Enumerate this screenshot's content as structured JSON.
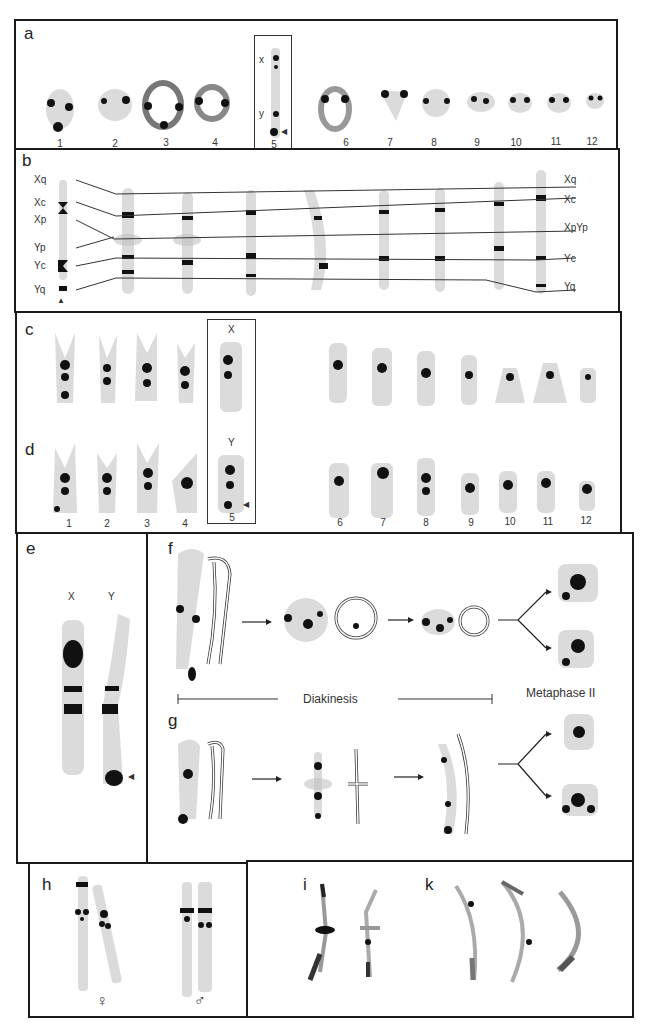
{
  "figure": {
    "panel_a": {
      "label": "a",
      "numbers": [
        "1",
        "2",
        "3",
        "4",
        "5",
        "6",
        "7",
        "8",
        "9",
        "10",
        "11",
        "12"
      ],
      "inset_labels": {
        "x": "x",
        "y": "y"
      },
      "arrowhead": "◀"
    },
    "panel_b": {
      "label": "b",
      "left_labels": [
        "Xq",
        "Xc",
        "Xp",
        "Yp",
        "Yc",
        "Yq"
      ],
      "right_labels": [
        "Xq",
        "Xc",
        "XpYp",
        "Yc",
        "Yq"
      ],
      "arrowhead": "▲"
    },
    "panel_c": {
      "label": "c",
      "inset_label": "X"
    },
    "panel_d": {
      "label": "d",
      "inset_label": "Y",
      "numbers": [
        "1",
        "2",
        "3",
        "4",
        "5",
        "6",
        "7",
        "8",
        "9",
        "10",
        "11",
        "12"
      ],
      "arrowhead": "◀"
    },
    "panel_e": {
      "label": "e",
      "x_label": "X",
      "y_label": "Y",
      "arrowhead": "◀"
    },
    "panel_f": {
      "label": "f",
      "stage_diakinesis": "Diakinesis",
      "stage_metaphase": "Metaphase II"
    },
    "panel_g": {
      "label": "g"
    },
    "panel_h": {
      "label": "h",
      "female_symbol": "♀",
      "male_symbol": "♂"
    },
    "panel_i": {
      "label": "i"
    },
    "panel_k": {
      "label": "k"
    }
  },
  "colors": {
    "border": "#1a1a1a",
    "chromatin": "#111111",
    "background": "#ffffff"
  }
}
